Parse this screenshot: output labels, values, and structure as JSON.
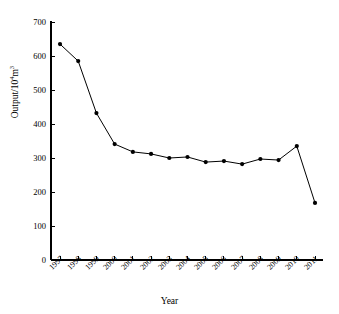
{
  "chart_data": {
    "type": "line",
    "title": "",
    "subtitle": "",
    "xlabel": "Year",
    "ylabel": "Output/10⁴m³",
    "ylabel_base": "Output/10",
    "ylabel_exp": "4",
    "ylabel_unit": "m",
    "ylabel_unit_exp": "3",
    "categories": [
      "1997",
      "1998",
      "1999",
      "2000",
      "2001",
      "2002",
      "2003",
      "2004",
      "2005",
      "2006",
      "2007",
      "2008",
      "2009",
      "2010",
      "2011"
    ],
    "values": [
      635,
      585,
      432,
      341,
      318,
      312,
      300,
      303,
      288,
      291,
      282,
      297,
      294,
      335,
      168
    ],
    "x": [
      1997,
      1998,
      1999,
      2000,
      2001,
      2002,
      2003,
      2004,
      2005,
      2006,
      2007,
      2008,
      2009,
      2010,
      2011
    ],
    "ylim": [
      0,
      700
    ],
    "yticks": [
      0,
      100,
      200,
      300,
      400,
      500,
      600,
      700
    ],
    "ytick_labels": [
      "0",
      "100",
      "200",
      "300",
      "400",
      "500",
      "600",
      "700"
    ],
    "grid": false,
    "legend": null,
    "legend_position": "none",
    "series": [
      {
        "name": "Output",
        "values": [
          635,
          585,
          432,
          341,
          318,
          312,
          300,
          303,
          288,
          291,
          282,
          297,
          294,
          335,
          168
        ],
        "marker": "filled-circle",
        "marker_color": "#000000",
        "line_color": "#000000",
        "line_width": 1
      }
    ],
    "annotations": [],
    "axis_color": "#000000",
    "background_color": "#ffffff"
  }
}
